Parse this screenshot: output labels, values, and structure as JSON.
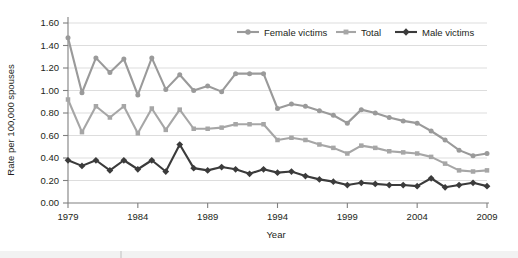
{
  "chart_data": {
    "type": "line",
    "title": "",
    "xlabel": "Year",
    "ylabel": "Rate per 100,000 spouses",
    "xlim": [
      1979,
      2009
    ],
    "ylim": [
      0.0,
      1.6
    ],
    "ytick_labels": [
      "0.00",
      "0.20",
      "0.40",
      "0.60",
      "0.80",
      "1.00",
      "1.20",
      "1.40",
      "1.60"
    ],
    "ytick_values": [
      0.0,
      0.2,
      0.4,
      0.6,
      0.8,
      1.0,
      1.2,
      1.4,
      1.6
    ],
    "xtick_labels": [
      "1979",
      "1984",
      "1989",
      "1994",
      "1999",
      "2004",
      "2009"
    ],
    "xtick_values": [
      1979,
      1984,
      1989,
      1994,
      1999,
      2004,
      2009
    ],
    "grid": "horizontal",
    "legend_position": "top-right",
    "x": [
      1979,
      1980,
      1981,
      1982,
      1983,
      1984,
      1985,
      1986,
      1987,
      1988,
      1989,
      1990,
      1991,
      1992,
      1993,
      1994,
      1995,
      1996,
      1997,
      1998,
      1999,
      2000,
      2001,
      2002,
      2003,
      2004,
      2005,
      2006,
      2007,
      2008,
      2009
    ],
    "series": [
      {
        "name": "Female victims",
        "color": "#9a9a9a",
        "marker": "circle",
        "values": [
          1.47,
          0.98,
          1.29,
          1.16,
          1.28,
          0.96,
          1.29,
          1.01,
          1.14,
          1.0,
          1.04,
          0.99,
          1.15,
          1.15,
          1.15,
          0.84,
          0.88,
          0.86,
          0.82,
          0.78,
          0.71,
          0.83,
          0.8,
          0.76,
          0.73,
          0.71,
          0.64,
          0.56,
          0.47,
          0.42,
          0.44
        ]
      },
      {
        "name": "Total",
        "color": "#a6a6a6",
        "marker": "square",
        "values": [
          0.92,
          0.63,
          0.86,
          0.76,
          0.86,
          0.62,
          0.84,
          0.65,
          0.83,
          0.66,
          0.66,
          0.67,
          0.7,
          0.7,
          0.7,
          0.56,
          0.58,
          0.56,
          0.52,
          0.49,
          0.44,
          0.51,
          0.49,
          0.46,
          0.45,
          0.44,
          0.41,
          0.35,
          0.29,
          0.28,
          0.29
        ]
      },
      {
        "name": "Male victims",
        "color": "#3b3b3b",
        "marker": "diamond",
        "values": [
          0.38,
          0.33,
          0.38,
          0.29,
          0.38,
          0.3,
          0.38,
          0.28,
          0.52,
          0.31,
          0.29,
          0.32,
          0.3,
          0.26,
          0.3,
          0.27,
          0.28,
          0.24,
          0.21,
          0.19,
          0.16,
          0.18,
          0.17,
          0.16,
          0.16,
          0.15,
          0.22,
          0.14,
          0.16,
          0.18,
          0.15
        ]
      }
    ]
  },
  "legend": {
    "items": [
      {
        "label": "Female victims"
      },
      {
        "label": "Total"
      },
      {
        "label": "Male victims"
      }
    ]
  }
}
